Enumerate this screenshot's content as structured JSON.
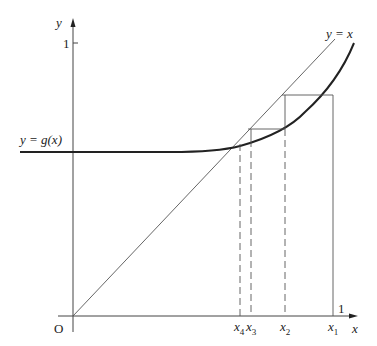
{
  "diagram": {
    "type": "cobweb fixed-point iteration",
    "axes": {
      "x_label": "x",
      "y_label": "y",
      "origin_label": "O",
      "x_tick_one": "1",
      "y_tick_one": "1"
    },
    "curves": {
      "identity_label": "y = x",
      "function_label": "y = g(x)"
    },
    "iterates": [
      {
        "name": "x1",
        "base": "x",
        "sub": "1"
      },
      {
        "name": "x2",
        "base": "x",
        "sub": "2"
      },
      {
        "name": "x3",
        "base": "x",
        "sub": "3"
      },
      {
        "name": "x4",
        "base": "x",
        "sub": "4"
      }
    ]
  }
}
